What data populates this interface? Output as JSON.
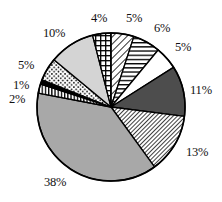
{
  "chart_data": {
    "type": "pie",
    "title": "",
    "subtitle": "",
    "xlabel": "",
    "ylabel": "",
    "grid": false,
    "legend": "none",
    "units": "percent",
    "total": 100,
    "start_angle_deg": 0,
    "direction": "clockwise",
    "categories": [
      "Slice 1",
      "Slice 2",
      "Slice 3",
      "Slice 4",
      "Slice 5",
      "Slice 6",
      "Slice 7",
      "Slice 8",
      "Slice 9",
      "Slice 10",
      "Slice 11"
    ],
    "values": [
      5,
      6,
      5,
      11,
      13,
      38,
      2,
      1,
      5,
      10,
      4
    ],
    "labels": [
      "5%",
      "6%",
      "5%",
      "11%",
      "13%",
      "38%",
      "2%",
      "1%",
      "5%",
      "10%",
      "4%"
    ],
    "slices": [
      {
        "label": "5%",
        "value": 5,
        "fill": "diagonal-hatch-right",
        "color": "#ffffff",
        "stroke": "#000000"
      },
      {
        "label": "6%",
        "value": 6,
        "fill": "horizontal-lines",
        "color": "#ffffff",
        "stroke": "#000000"
      },
      {
        "label": "5%",
        "value": 5,
        "fill": "solid-white",
        "color": "#ffffff",
        "stroke": "#000000"
      },
      {
        "label": "11%",
        "value": 11,
        "fill": "solid-dark-gray",
        "color": "#4d4d4d",
        "stroke": "#000000"
      },
      {
        "label": "13%",
        "value": 13,
        "fill": "dense-diagonal-hatch",
        "color": "#ffffff",
        "stroke": "#000000"
      },
      {
        "label": "38%",
        "value": 38,
        "fill": "solid-medium-gray",
        "color": "#a8a8a8",
        "stroke": "#000000"
      },
      {
        "label": "2%",
        "value": 2,
        "fill": "vertical-stripes",
        "color": "#ffffff",
        "stroke": "#000000"
      },
      {
        "label": "1%",
        "value": 1,
        "fill": "solid-black",
        "color": "#000000",
        "stroke": "#000000"
      },
      {
        "label": "5%",
        "value": 5,
        "fill": "dotted-stipple",
        "color": "#ffffff",
        "stroke": "#000000"
      },
      {
        "label": "10%",
        "value": 10,
        "fill": "solid-light-gray",
        "color": "#d4d4d4",
        "stroke": "#000000"
      },
      {
        "label": "4%",
        "value": 4,
        "fill": "cross-hatch",
        "color": "#ffffff",
        "stroke": "#000000"
      }
    ],
    "label_positions": [
      {
        "label": "4%",
        "x": 91,
        "y": 12
      },
      {
        "label": "5%",
        "x": 126,
        "y": 12
      },
      {
        "label": "6%",
        "x": 154,
        "y": 22
      },
      {
        "label": "5%",
        "x": 175,
        "y": 41
      },
      {
        "label": "11%",
        "x": 190,
        "y": 84
      },
      {
        "label": "13%",
        "x": 186,
        "y": 146
      },
      {
        "label": "38%",
        "x": 44,
        "y": 176
      },
      {
        "label": "2%",
        "x": 9,
        "y": 93
      },
      {
        "label": "1%",
        "x": 13,
        "y": 79
      },
      {
        "label": "5%",
        "x": 18,
        "y": 59
      },
      {
        "label": "10%",
        "x": 43,
        "y": 27
      }
    ],
    "geometry": {
      "cx": 111,
      "cy": 107,
      "r": 74
    }
  },
  "colors": {
    "background": "#ffffff",
    "outline": "#000000",
    "text": "#111111",
    "dark_gray": "#4d4d4d",
    "medium_gray": "#a8a8a8",
    "light_gray": "#d4d4d4",
    "black": "#000000"
  }
}
